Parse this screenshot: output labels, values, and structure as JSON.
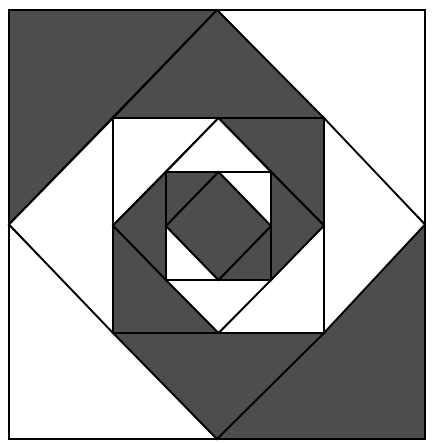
{
  "colors": {
    "dark": "#4d4d4d",
    "light": "#ffffff",
    "stroke": "#000000"
  },
  "levels": [
    {
      "name": "outer",
      "square": {
        "left": 9,
        "top": 10,
        "right": 425,
        "bottom": 439
      },
      "corner_fills": {
        "top_left": "dark",
        "top_right": "light",
        "bottom_right": "dark",
        "bottom_left": "light"
      }
    },
    {
      "name": "ring-1",
      "square": {
        "left": 113,
        "top": 118,
        "right": 324,
        "bottom": 333
      },
      "gap_fills": {
        "top": "dark",
        "right": "light",
        "bottom": "dark",
        "left": "light"
      },
      "corner_fills": {
        "top_left": "light",
        "top_right": "dark",
        "bottom_right": "light",
        "bottom_left": "dark"
      }
    },
    {
      "name": "ring-2",
      "square": {
        "left": 166,
        "top": 172,
        "right": 271,
        "bottom": 280
      },
      "gap_fills": {
        "top": "light",
        "right": "dark",
        "bottom": "light",
        "left": "dark"
      },
      "corner_fills": {
        "top_left": "dark",
        "top_right": "light",
        "bottom_right": "dark",
        "bottom_left": "light"
      },
      "center_diamond_fill": "dark"
    }
  ]
}
